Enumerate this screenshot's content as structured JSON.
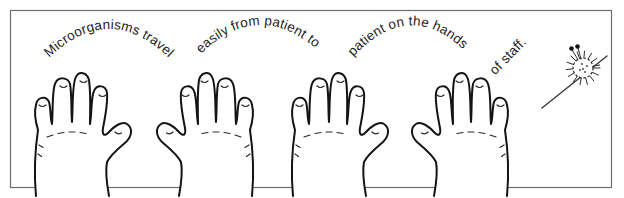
{
  "illustration": {
    "background_color": "#ffffff",
    "frame_color": "#6e6e6e",
    "ink_color": "#1e1e1e",
    "arc_labels": [
      "Microorganisms travel",
      "easily from patient to",
      "patient on the hands",
      "of staff."
    ],
    "hand_count": 4,
    "icons": [
      "hand-outline-icon",
      "spiky-microbe-icon"
    ]
  }
}
